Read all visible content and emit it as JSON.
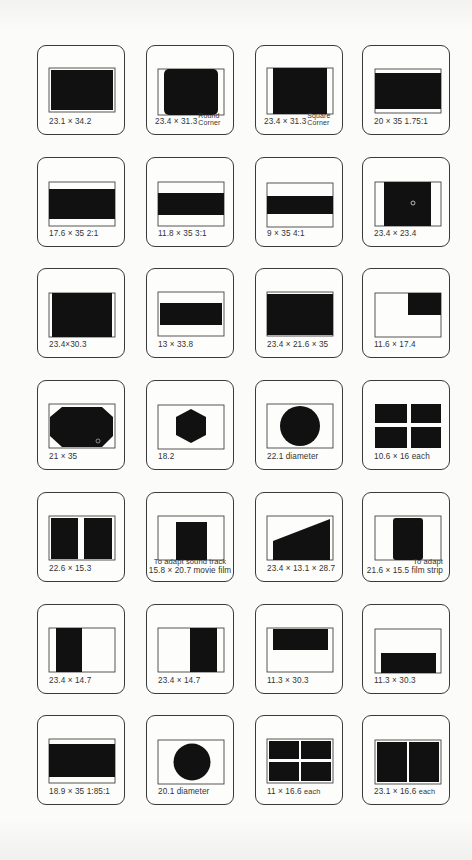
{
  "page": {
    "background": "#fbfbfa",
    "ink": "#111111",
    "border": "#3a3a3a"
  },
  "slides": [
    {
      "id": 1,
      "label": "23.1 × 34.2",
      "shape": "full-rect"
    },
    {
      "id": 2,
      "label": "23.4 × 31.3",
      "note_line1": "Round",
      "note_line2": "Corner",
      "shape": "rounded-rect"
    },
    {
      "id": 3,
      "label": "23.4 × 31.3",
      "note_line1": "Square",
      "note_line2": "Corner",
      "shape": "square-corner-rect"
    },
    {
      "id": 4,
      "label": "20 × 35   1.75:1",
      "shape": "wide-band"
    },
    {
      "id": 5,
      "label": "17.6 × 35   2:1",
      "shape": "band-2-1"
    },
    {
      "id": 6,
      "label": "11.8 × 35   3:1",
      "shape": "band-3-1"
    },
    {
      "id": 7,
      "label": "9 × 35   4:1",
      "shape": "band-4-1"
    },
    {
      "id": 8,
      "label": "23.4 × 23.4",
      "shape": "square"
    },
    {
      "id": 9,
      "label": "23.4×30.3",
      "shape": "rect-30-3"
    },
    {
      "id": 10,
      "label": "13 × 33.8",
      "shape": "band-13"
    },
    {
      "id": 11,
      "label": "23.4 × 21.6 × 35",
      "shape": "near-full"
    },
    {
      "id": 12,
      "label": "11.6 × 17.4",
      "shape": "top-right-quarter"
    },
    {
      "id": 13,
      "label": "21 × 35",
      "shape": "octagon"
    },
    {
      "id": 14,
      "label": "18.2",
      "shape": "hexagon"
    },
    {
      "id": 15,
      "label": "22.1 diameter",
      "shape": "circle-large"
    },
    {
      "id": 16,
      "label": "10.6 × 16 each",
      "shape": "quad-cross"
    },
    {
      "id": 17,
      "label": "22.6 × 15.3",
      "shape": "dual-vertical"
    },
    {
      "id": 18,
      "label": "15.8 × 20.7 movie film",
      "note_line1": "To adapt sound track",
      "shape": "center-tall"
    },
    {
      "id": 19,
      "label": "23.4 × 13.1 × 28.7",
      "shape": "trapezoid"
    },
    {
      "id": 20,
      "label": "21.6 × 15.5 film strip",
      "note_line1": "To adapt",
      "shape": "rounded-tall"
    },
    {
      "id": 21,
      "label": "23.4 × 14.7",
      "shape": "left-half"
    },
    {
      "id": 22,
      "label": "23.4 × 14.7",
      "shape": "right-half"
    },
    {
      "id": 23,
      "label": "11.3 × 30.3",
      "shape": "top-band"
    },
    {
      "id": 24,
      "label": "11.3 × 30.3",
      "shape": "bottom-band"
    },
    {
      "id": 25,
      "label": "18.9 × 35 1:85:1",
      "shape": "band-1-85"
    },
    {
      "id": 26,
      "label": "20.1 diameter",
      "shape": "circle-small"
    },
    {
      "id": 27,
      "label": "11 × 16.6",
      "label_suffix": "each",
      "shape": "quad-grid"
    },
    {
      "id": 28,
      "label": "23.1 × 16.6",
      "label_suffix": "each",
      "shape": "dual-split"
    }
  ]
}
